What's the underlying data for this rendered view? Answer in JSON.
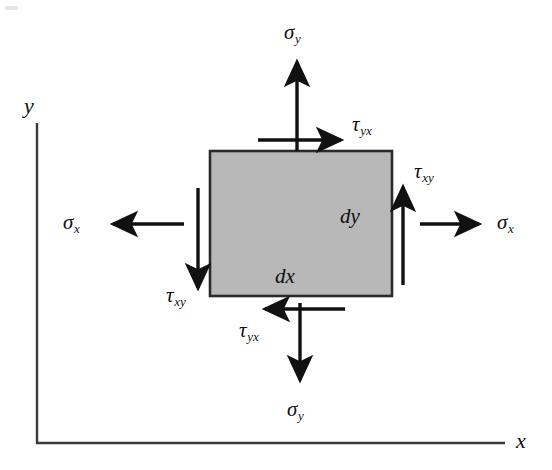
{
  "figure": {
    "background_color": "#ffffff",
    "ink_color": "#111111",
    "element_fill_color": "#b8b8b8",
    "element_stroke_color": "#2b2b2b"
  },
  "axes": {
    "x_label": "x",
    "y_label": "y",
    "origin": {
      "x": 37,
      "y": 443
    },
    "x_end": {
      "x": 505,
      "y": 443
    },
    "y_top": {
      "x": 37,
      "y": 123
    }
  },
  "element": {
    "x": 210,
    "y": 151,
    "width": 182,
    "height": 145,
    "dx_label": "dx",
    "dy_label": "dy"
  },
  "stresses": [
    {
      "id": "sigma-y-top",
      "symbol": "σ",
      "subscript": "y",
      "label": "σy",
      "kind": "normal",
      "face": "top",
      "direction": "up",
      "label_x": 284,
      "label_y": 22
    },
    {
      "id": "tau-yx-top",
      "symbol": "τ",
      "subscript": "yx",
      "label": "τyx",
      "kind": "shear",
      "face": "top",
      "direction": "right",
      "label_x": 352,
      "label_y": 114
    },
    {
      "id": "tau-xy-right",
      "symbol": "τ",
      "subscript": "xy",
      "label": "τxy",
      "kind": "shear",
      "face": "right",
      "direction": "up",
      "label_x": 414,
      "label_y": 161
    },
    {
      "id": "sigma-x-right",
      "symbol": "σ",
      "subscript": "x",
      "label": "σx",
      "kind": "normal",
      "face": "right",
      "direction": "right",
      "label_x": 497,
      "label_y": 212
    },
    {
      "id": "sigma-x-left",
      "symbol": "σ",
      "subscript": "x",
      "label": "σx",
      "kind": "normal",
      "face": "left",
      "direction": "left",
      "label_x": 63,
      "label_y": 212
    },
    {
      "id": "tau-xy-left",
      "symbol": "τ",
      "subscript": "xy",
      "label": "τxy",
      "kind": "shear",
      "face": "left",
      "direction": "down",
      "label_x": 166,
      "label_y": 285
    },
    {
      "id": "tau-yx-bottom",
      "symbol": "τ",
      "subscript": "yx",
      "label": "τyx",
      "kind": "shear",
      "face": "bottom",
      "direction": "left",
      "label_x": 239,
      "label_y": 320
    },
    {
      "id": "sigma-y-bottom",
      "symbol": "σ",
      "subscript": "y",
      "label": "σy",
      "kind": "normal",
      "face": "bottom",
      "direction": "down",
      "label_x": 287,
      "label_y": 399
    }
  ]
}
